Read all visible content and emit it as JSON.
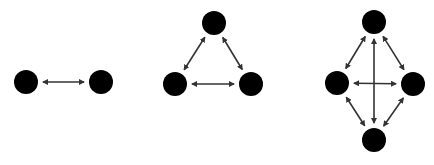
{
  "diagram": {
    "title": "",
    "colors": {
      "background": "#ffffff",
      "node_fill": "#000000",
      "edge_stroke": "#333333"
    },
    "graphs": [
      {
        "id": "pair",
        "node_count": 2,
        "nodes": [
          "a",
          "b"
        ],
        "edges": [
          {
            "from": "a",
            "to": "b",
            "directed": "both"
          }
        ]
      },
      {
        "id": "triangle",
        "node_count": 3,
        "nodes": [
          "top",
          "left",
          "right"
        ],
        "edges": [
          {
            "from": "top",
            "to": "left",
            "directed": "both"
          },
          {
            "from": "top",
            "to": "right",
            "directed": "both"
          },
          {
            "from": "left",
            "to": "right",
            "directed": "both"
          }
        ]
      },
      {
        "id": "diamond",
        "node_count": 4,
        "nodes": [
          "top",
          "left",
          "right",
          "bottom"
        ],
        "edges": [
          {
            "from": "top",
            "to": "left",
            "directed": "both"
          },
          {
            "from": "top",
            "to": "right",
            "directed": "both"
          },
          {
            "from": "left",
            "to": "bottom",
            "directed": "both"
          },
          {
            "from": "right",
            "to": "bottom",
            "directed": "both"
          },
          {
            "from": "top",
            "to": "bottom",
            "directed": "both"
          },
          {
            "from": "left",
            "to": "right",
            "directed": "both"
          }
        ]
      }
    ]
  }
}
